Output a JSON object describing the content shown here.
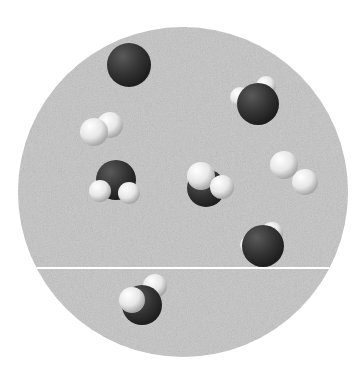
{
  "diagram": {
    "container_shape": "circle",
    "colors": {
      "background": "#c4c4c4",
      "oxygen": "#3a3a3a",
      "hydrogen": "#f2f2f2",
      "divider": "#ffffff"
    },
    "divider": "horizontal line near the bottom of the container",
    "molecules": [
      {
        "type": "water",
        "label": "H2O",
        "atoms": [
          "O",
          "H",
          "H"
        ]
      },
      {
        "type": "water",
        "label": "H2O",
        "atoms": [
          "O",
          "H",
          "H"
        ]
      },
      {
        "type": "hydrogen",
        "label": "H2",
        "atoms": [
          "H",
          "H"
        ]
      },
      {
        "type": "water",
        "label": "H2O",
        "atoms": [
          "O",
          "H",
          "H"
        ]
      },
      {
        "type": "water",
        "label": "H2O",
        "atoms": [
          "O",
          "H",
          "H"
        ]
      },
      {
        "type": "hydrogen",
        "label": "H2",
        "atoms": [
          "H",
          "H"
        ]
      },
      {
        "type": "water",
        "label": "H2O",
        "atoms": [
          "O",
          "H",
          "H"
        ]
      },
      {
        "type": "water",
        "label": "H2O",
        "atoms": [
          "O",
          "H",
          "H"
        ]
      }
    ]
  }
}
